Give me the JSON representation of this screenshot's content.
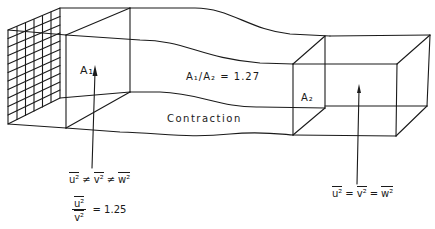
{
  "diagram": {
    "type": "wind-tunnel contraction schematic",
    "stroke_color": "#1a1a1a",
    "background": "#ffffff"
  },
  "labels": {
    "inlet_area": "A₁",
    "area_ratio": "A₁/A₂ = 1.27",
    "section_name": "Contraction",
    "outlet_area": "A₂"
  },
  "inlet_equation": {
    "terms": [
      "u²",
      "v²",
      "w²"
    ],
    "operator": "≠"
  },
  "inlet_ratio": {
    "numerator": "u²",
    "denominator": "v²",
    "equals": "= 1.25"
  },
  "outlet_equation": {
    "terms": [
      "u²",
      "v²",
      "w²"
    ],
    "operator": "="
  }
}
